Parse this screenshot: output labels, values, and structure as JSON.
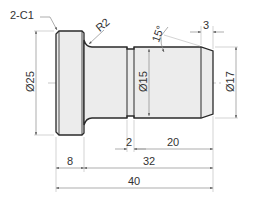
{
  "drawing": {
    "type": "mechanical-part-drawing",
    "part": "stepped pin with flange",
    "colors": {
      "outline": "#2a2a2a",
      "fill": "#ececec",
      "fill_light": "#f4f4f4",
      "dim_line": "#9a9a9a",
      "text": "#333333",
      "centerline": "#b0b0b0"
    }
  },
  "annotations": {
    "chamfer_note": "2-C1",
    "fillet_radius": "R2",
    "chamfer_angle": "15°",
    "chamfer_length": "3",
    "dia_flange": "Ø25",
    "dia_groove": "Ø15",
    "dia_shank": "Ø17"
  },
  "dimensions": {
    "flange_width": "8",
    "groove_width": "2",
    "tip_length": "20",
    "shank_length": "32",
    "overall_length": "40"
  }
}
